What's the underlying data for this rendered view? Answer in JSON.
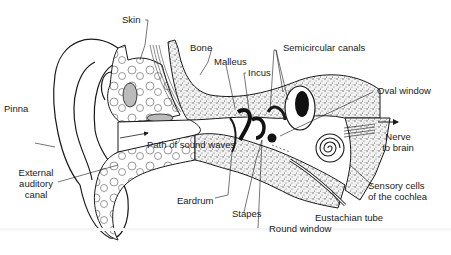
{
  "labels": {
    "skin": "Skin",
    "bone": "Bone",
    "malleus": "Malleus",
    "incus": "Incus",
    "semicircular_canals": "Semicircular canals",
    "oval_window": "Oval window",
    "pinna": "Pinna",
    "path_of_sound_waves": "Path of sound waves",
    "nerve_to_brain_1": "Nerve",
    "nerve_to_brain_2": "to brain",
    "external_auditory_canal_1": "External",
    "external_auditory_canal_2": "auditory",
    "external_auditory_canal_3": "canal",
    "sensory_cells_1": "Sensory cells",
    "sensory_cells_2": "of the cochlea",
    "eardrum": "Eardrum",
    "stapes": "Stapes",
    "eustachian_tube": "Eustachian tube",
    "round_window": "Round window"
  },
  "colors": {
    "ink": "#1a1a1a",
    "bone_stipple": "#8a8a8a",
    "background": "#ffffff"
  }
}
